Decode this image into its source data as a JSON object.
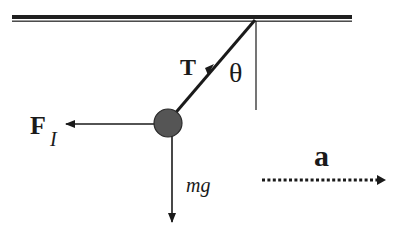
{
  "diagram": {
    "labels": {
      "tension": "T",
      "angle": "θ",
      "inertial_force_main": "F",
      "inertial_force_sub": "I",
      "weight": "mg",
      "acceleration": "a"
    },
    "elements": [
      {
        "name": "ceiling",
        "type": "fixed-support"
      },
      {
        "name": "string",
        "type": "line",
        "force": "tension"
      },
      {
        "name": "vertical-reference",
        "type": "line"
      },
      {
        "name": "bob",
        "type": "mass"
      },
      {
        "name": "inertial-force-arrow",
        "direction": "left"
      },
      {
        "name": "weight-arrow",
        "direction": "down"
      },
      {
        "name": "acceleration-arrow",
        "direction": "right",
        "style": "dotted"
      }
    ],
    "colors": {
      "ink": "#1a1a1a",
      "bob_fill": "#555555",
      "background": "#ffffff"
    }
  }
}
